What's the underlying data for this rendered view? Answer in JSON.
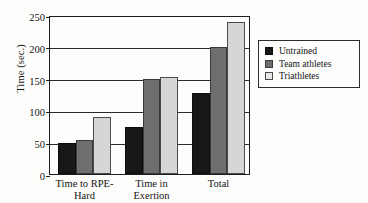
{
  "chart_data": {
    "type": "bar",
    "title": "",
    "xlabel": "",
    "ylabel": "Time (sec.)",
    "ylim": [
      0,
      250
    ],
    "ytick_step": 50,
    "yticks": [
      "0",
      "50",
      "100",
      "150",
      "200",
      "250"
    ],
    "grid": "horizontal",
    "legend_position": "right-outside",
    "categories": [
      "Time to RPE-\nHard",
      "Time in\nExertion",
      "Total"
    ],
    "category_plain": [
      "Time to RPE-Hard",
      "Time in Exertion",
      "Total"
    ],
    "series": [
      {
        "name": "Untrained",
        "color": "#18181a",
        "values": [
          49,
          74,
          128
        ]
      },
      {
        "name": "Team athletes",
        "color": "#6e6e70",
        "values": [
          53,
          149,
          199
        ]
      },
      {
        "name": "Triathletes",
        "color": "#e8e8e6",
        "values": [
          90,
          153,
          239
        ]
      }
    ]
  }
}
